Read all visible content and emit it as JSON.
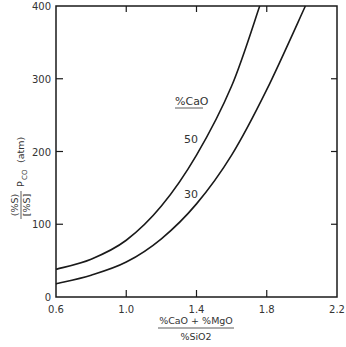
{
  "chart_data": {
    "type": "line",
    "title": "",
    "xlabel": {
      "numerator": "%CaO + %MgO",
      "denominator": "%SiO2"
    },
    "ylabel": {
      "numerator": "(%S)",
      "denominator": "[%S]",
      "suffix": "P",
      "subscript": "CO",
      "unit": "(atm)"
    },
    "xlim": [
      0.6,
      2.2
    ],
    "ylim": [
      0,
      400
    ],
    "x_ticks": [
      "0.6",
      "1.0",
      "1.4",
      "1.8",
      "2.2"
    ],
    "y_ticks": [
      "0",
      "100",
      "200",
      "300",
      "400"
    ],
    "grid": false,
    "legend": {
      "title": "%CaO",
      "position": "inline annotations"
    },
    "series": [
      {
        "name": "50",
        "x": [
          0.6,
          0.8,
          1.0,
          1.2,
          1.4,
          1.6,
          1.76
        ],
        "y": [
          38,
          52,
          78,
          125,
          195,
          290,
          400
        ]
      },
      {
        "name": "30",
        "x": [
          0.6,
          0.8,
          1.0,
          1.2,
          1.4,
          1.6,
          1.8,
          2.02
        ],
        "y": [
          18,
          30,
          48,
          80,
          128,
          195,
          285,
          400
        ]
      }
    ]
  },
  "annotations": {
    "legend_title": "%CaO",
    "label_50": "50",
    "label_30": "30"
  },
  "colors": {
    "line": "#1a1a1a",
    "axis": "#1a1a1a",
    "text": "#333333",
    "background": "#ffffff"
  }
}
